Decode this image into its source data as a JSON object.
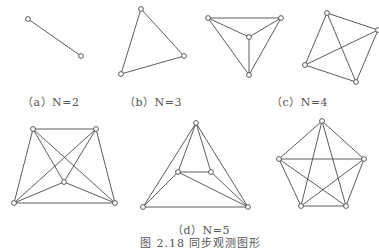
{
  "figure": {
    "caption": "图 2.18  同步观测图形",
    "line_color": "#4a4a4a",
    "text_color": "#555555"
  },
  "panels": [
    {
      "id": "a",
      "label": "（a）N=2"
    },
    {
      "id": "b",
      "label": "（b）N=3"
    },
    {
      "id": "c",
      "label": "（c）N=4"
    },
    {
      "id": "d",
      "label": "（d）N=5"
    }
  ],
  "graphs": [
    {
      "name": "n2",
      "nodes": [
        [
          28,
          19
        ],
        [
          81,
          56
        ]
      ],
      "edges": [
        [
          0,
          1
        ]
      ]
    },
    {
      "name": "n3",
      "nodes": [
        [
          141,
          9
        ],
        [
          184,
          56
        ],
        [
          121,
          74
        ]
      ],
      "edges": [
        [
          0,
          1
        ],
        [
          1,
          2
        ],
        [
          2,
          0
        ]
      ]
    },
    {
      "name": "n4-triangle",
      "nodes": [
        [
          208,
          18
        ],
        [
          281,
          18
        ],
        [
          249,
          37
        ],
        [
          249,
          75
        ]
      ],
      "edges": [
        [
          0,
          1
        ],
        [
          0,
          2
        ],
        [
          1,
          2
        ],
        [
          0,
          3
        ],
        [
          1,
          3
        ],
        [
          2,
          3
        ]
      ]
    },
    {
      "name": "n4-quad",
      "nodes": [
        [
          327,
          13
        ],
        [
          378,
          30
        ],
        [
          305,
          65
        ],
        [
          356,
          82
        ]
      ],
      "edges": [
        [
          0,
          1
        ],
        [
          0,
          2
        ],
        [
          1,
          3
        ],
        [
          2,
          3
        ],
        [
          0,
          3
        ],
        [
          1,
          2
        ]
      ]
    },
    {
      "name": "n5-trapezoid",
      "nodes": [
        [
          33,
          129
        ],
        [
          96,
          129
        ],
        [
          64,
          182
        ],
        [
          14,
          203
        ],
        [
          115,
          203
        ]
      ],
      "edges": [
        [
          0,
          1
        ],
        [
          0,
          3
        ],
        [
          1,
          4
        ],
        [
          3,
          4
        ],
        [
          0,
          2
        ],
        [
          1,
          2
        ],
        [
          0,
          4
        ],
        [
          1,
          3
        ],
        [
          3,
          2
        ],
        [
          4,
          2
        ]
      ]
    },
    {
      "name": "n5-triangle",
      "nodes": [
        [
          196,
          123
        ],
        [
          178,
          172
        ],
        [
          211,
          172
        ],
        [
          143,
          207
        ],
        [
          248,
          207
        ]
      ],
      "edges": [
        [
          0,
          3
        ],
        [
          0,
          4
        ],
        [
          0,
          1
        ],
        [
          0,
          2
        ],
        [
          1,
          2
        ],
        [
          1,
          3
        ],
        [
          1,
          4
        ],
        [
          2,
          4
        ],
        [
          3,
          4
        ]
      ]
    },
    {
      "name": "n5-pentagon",
      "nodes": [
        [
          322,
          121
        ],
        [
          279,
          159
        ],
        [
          364,
          159
        ],
        [
          301,
          206
        ],
        [
          346,
          206
        ]
      ],
      "edges": [
        [
          0,
          1
        ],
        [
          0,
          2
        ],
        [
          0,
          3
        ],
        [
          0,
          4
        ],
        [
          1,
          2
        ],
        [
          1,
          3
        ],
        [
          1,
          4
        ],
        [
          2,
          3
        ],
        [
          2,
          4
        ],
        [
          3,
          4
        ]
      ]
    }
  ]
}
